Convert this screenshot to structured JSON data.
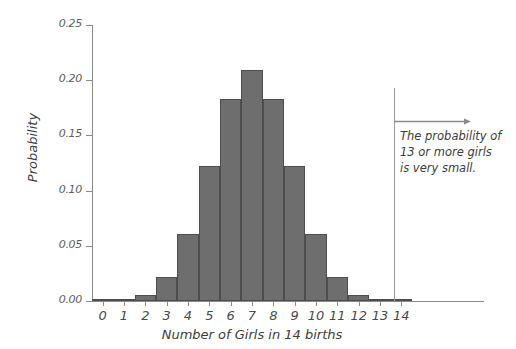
{
  "chart_data": {
    "type": "bar",
    "title": "",
    "xlabel": "Number of Girls in 14 births",
    "ylabel": "Probability",
    "categories": [
      "0",
      "1",
      "2",
      "3",
      "4",
      "5",
      "6",
      "7",
      "8",
      "9",
      "10",
      "11",
      "12",
      "13",
      "14"
    ],
    "values": [
      0.0001,
      0.0009,
      0.0056,
      0.0222,
      0.0611,
      0.1222,
      0.1833,
      0.2095,
      0.1833,
      0.1222,
      0.0611,
      0.0222,
      0.0056,
      0.0009,
      0.0001
    ],
    "ylim": [
      0.0,
      0.25
    ],
    "xlim": [
      -0.5,
      14.5
    ],
    "ytick_labels": [
      "0.00",
      "0.05",
      "0.10",
      "0.15",
      "0.20",
      "0.25"
    ],
    "ytick_values": [
      0.0,
      0.05,
      0.1,
      0.15,
      0.2,
      0.25
    ],
    "grid": false,
    "legend": "none",
    "bar_color": "#6e6e6e",
    "bar_edge_color": "#4d4d4d",
    "axis_color": "#8a8a8a",
    "annotations": [
      {
        "name": "tail-annotation",
        "lines": [
          "The probability of",
          "13 or more girls",
          "is very small."
        ],
        "marker_x": 12.5,
        "arrow_direction": "right",
        "color": "#3d3d3d"
      }
    ]
  },
  "annotation": {
    "line1": "The probability of",
    "line2": "13 or more girls",
    "line3": "is very small."
  }
}
